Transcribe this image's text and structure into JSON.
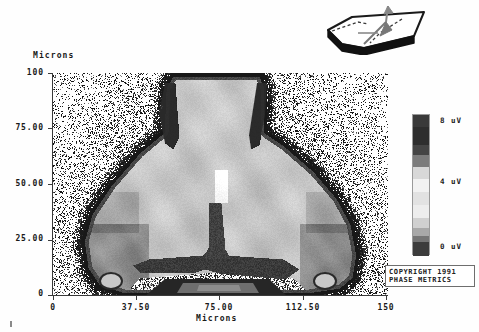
{
  "plot": {
    "y_axis": {
      "title": "Microns",
      "ticks": [
        "100",
        "75.00",
        "50.00",
        "25.00",
        "0"
      ],
      "values": [
        100,
        75,
        50,
        25,
        0
      ]
    },
    "x_axis": {
      "title": "Microns",
      "ticks": [
        "0",
        "37.50",
        "75.00",
        "112.50",
        "150"
      ],
      "values": [
        0,
        37.5,
        75,
        112.5,
        150
      ]
    }
  },
  "colorbar": {
    "labels": [
      {
        "text": "8 uV",
        "top": 2
      },
      {
        "text": "4 uV",
        "top": 63
      },
      {
        "text": "0 uV",
        "top": 128
      }
    ],
    "bands": [
      {
        "color": "#3a3a3a",
        "height": 12
      },
      {
        "color": "#2e2e2e",
        "height": 18
      },
      {
        "color": "#454545",
        "height": 10
      },
      {
        "color": "#7c7c7c",
        "height": 12
      },
      {
        "color": "#d8d8d8",
        "height": 12
      },
      {
        "color": "#f2f2f2",
        "height": 13
      },
      {
        "color": "#e2e2e2",
        "height": 13
      },
      {
        "color": "#ededed",
        "height": 13
      },
      {
        "color": "#d0d0d0",
        "height": 10
      },
      {
        "color": "#a8a8a8",
        "height": 8
      },
      {
        "color": "#757575",
        "height": 6
      },
      {
        "color": "#3c3c3c",
        "height": 14
      }
    ]
  },
  "copyright": {
    "line1": "COPYRIGHT 1991",
    "line2": "PHASE METRICS"
  },
  "inset": {
    "name": "slider-orientation-diagram"
  },
  "chart_data": {
    "type": "heatmap",
    "title": "",
    "xlabel": "Microns",
    "ylabel": "Microns",
    "xlim": [
      0,
      150
    ],
    "ylim": [
      0,
      100
    ],
    "xticks": [
      0,
      37.5,
      75,
      112.5,
      150
    ],
    "yticks": [
      0,
      25,
      50,
      75,
      100
    ],
    "grid": false,
    "colorbar": {
      "label": "uV",
      "ticks": [
        0,
        4,
        8
      ],
      "ticklabels": [
        "0 uV",
        "4 uV",
        "8 uV"
      ],
      "range": [
        0,
        8
      ]
    },
    "palette": [
      "#1e1e1e",
      "#3a3a3a",
      "#5a5a5a",
      "#7c7c7c",
      "#9c9c9c",
      "#bcbcbc",
      "#d8d8d8",
      "#f0f0f0",
      "#ffffff"
    ]
  }
}
